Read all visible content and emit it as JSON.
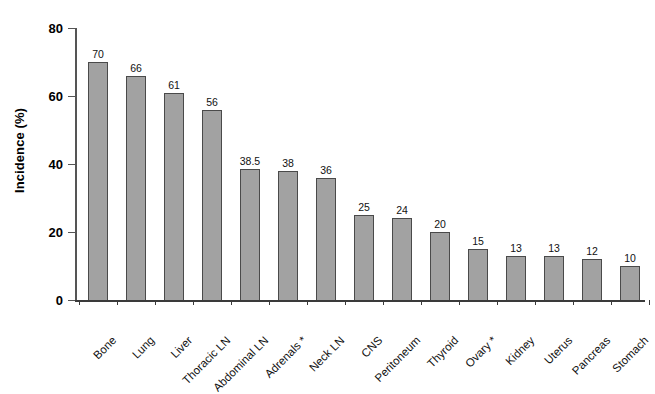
{
  "chart_data": {
    "type": "bar",
    "title": "",
    "subtitle": "",
    "xlabel": "",
    "ylabel": "Incidence (%)",
    "ylim": [
      0,
      80
    ],
    "yticks": [
      0,
      20,
      40,
      60,
      80
    ],
    "grid": false,
    "legend": null,
    "bar_color": "#a2a2a2",
    "bar_edge_color": "#4a4a4a",
    "value_labels_shown": true,
    "categories": [
      "Bone",
      "Lung",
      "Liver",
      "Thoracic LN",
      "Abdominal LN",
      "Adrenals *",
      "Neck LN",
      "CNS",
      "Peritoneum",
      "Thyroid",
      "Ovary *",
      "Kidney",
      "Uterus",
      "Pancreas",
      "Stomach"
    ],
    "values": [
      70,
      66,
      61,
      56,
      38.5,
      38,
      36,
      25,
      24,
      20,
      15,
      13,
      13,
      12,
      10
    ],
    "value_labels": [
      "70",
      "66",
      "61",
      "56",
      "38.5",
      "38",
      "36",
      "25",
      "24",
      "20",
      "15",
      "13",
      "13",
      "12",
      "10"
    ],
    "annotations": [
      "* denotes sex-specific site"
    ]
  },
  "axis": {
    "y_tick_labels": [
      "0",
      "20",
      "40",
      "60",
      "80"
    ],
    "y_axis_title": "Incidence (%)"
  }
}
